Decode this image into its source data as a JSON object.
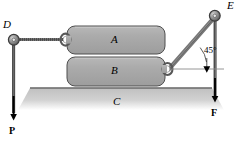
{
  "figure": {
    "type": "mechanics-free-body-diagram",
    "background_color": "#ffffff",
    "block_fill": "#a9a9a9",
    "block_stroke": "#4d4d4d",
    "ground_fill": "#b9b9b9",
    "rope_color": "#6e6e6e",
    "arrow_color": "#000000"
  },
  "labels": {
    "block_a": "A",
    "block_b": "B",
    "surface_c": "C",
    "pulley_d": "D",
    "pulley_e": "E",
    "force_p": "P",
    "force_f": "F",
    "angle": "45°"
  },
  "geometry": {
    "pulley_d": {
      "x": 14,
      "y": 40,
      "r": 5
    },
    "pulley_e": {
      "x": 215,
      "y": 16,
      "r": 5
    },
    "block_a": {
      "x": 67,
      "y": 26,
      "w": 98,
      "h": 28
    },
    "block_b": {
      "x": 67,
      "y": 57,
      "w": 98,
      "h": 29
    },
    "ground_line_y": 88,
    "eyelet_a_left": {
      "x": 66,
      "y": 40
    },
    "eyelet_b_right": {
      "x": 167,
      "y": 69
    },
    "angle_value_deg": 45,
    "force_p_arrow": {
      "x": 14,
      "y_start": 45,
      "y_end": 122
    },
    "force_f_arrow": {
      "x": 215,
      "y_start": 22,
      "y_end": 104
    }
  },
  "styles": {
    "label_size_px": 11,
    "angle_label_size_px": 9,
    "force_label_size_px": 10
  }
}
